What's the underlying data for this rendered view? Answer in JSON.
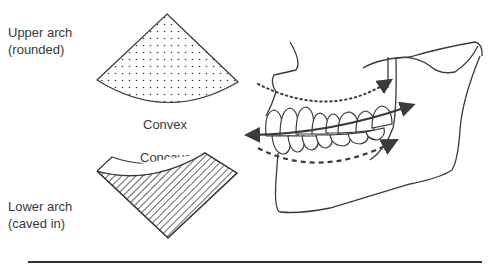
{
  "upper": {
    "label_line1": "Upper arch",
    "label_line2": "(rounded)",
    "shape_label": "Convex",
    "fill_pattern": "dots"
  },
  "lower": {
    "label_line1": "Lower arch",
    "label_line2": "(caved in)",
    "shape_label": "Concave",
    "fill_pattern": "diagonal-hatch"
  },
  "jaw_illustration": {
    "upper_curve_style": "dotted",
    "lower_curve_style": "dashed",
    "occlusal_plane": "double-headed arrow"
  },
  "colors": {
    "line": "#3a3a3a",
    "background": "#ffffff"
  }
}
